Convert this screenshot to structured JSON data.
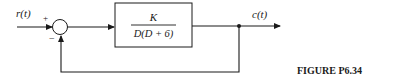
{
  "diagram": {
    "type": "feedback-control-block-diagram",
    "input": {
      "label": "r(t)"
    },
    "output": {
      "label": "c(t)"
    },
    "summing_junction": {
      "plus_sign": "+",
      "minus_sign": "−"
    },
    "forward_block": {
      "numerator": "K",
      "denominator": "D(D + 6)"
    },
    "feedback": "unity negative",
    "caption": "FIGURE P6.34"
  },
  "colors": {
    "line": "#1a1a1a",
    "background": "#ffffff"
  }
}
